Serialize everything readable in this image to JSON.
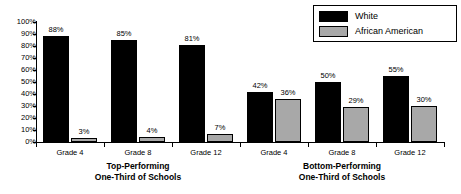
{
  "chart_data": {
    "type": "bar",
    "title": "",
    "xlabel": "",
    "ylabel": "",
    "ylim": [
      0,
      100
    ],
    "grid": false,
    "legend_position": "top-right",
    "categories": [
      "Grade 4",
      "Grade 8",
      "Grade 12",
      "Grade 4",
      "Grade 8",
      "Grade 12"
    ],
    "groups": [
      {
        "name": "Top-Performing One-Third of Schools",
        "title_line1": "Top-Performing",
        "title_line2": "One-Third of Schools",
        "categories": [
          "Grade 4",
          "Grade 8",
          "Grade 12"
        ]
      },
      {
        "name": "Bottom-Performing One-Third of Schools",
        "title_line1": "Bottom-Performing",
        "title_line2": "One-Third of Schools",
        "categories": [
          "Grade 4",
          "Grade 8",
          "Grade 12"
        ]
      }
    ],
    "series": [
      {
        "name": "White",
        "color": "#000000",
        "values": [
          88,
          85,
          81,
          42,
          50,
          55
        ],
        "labels": [
          "88%",
          "85%",
          "81%",
          "42%",
          "50%",
          "55%"
        ]
      },
      {
        "name": "African American",
        "color": "#a8a8a8",
        "values": [
          3,
          4,
          7,
          36,
          29,
          30
        ],
        "labels": [
          "3%",
          "4%",
          "7%",
          "36%",
          "29%",
          "30%"
        ]
      }
    ],
    "ytick_labels": [
      "100%",
      "90%",
      "80%",
      "70%",
      "60%",
      "50%",
      "40%",
      "30%",
      "20%",
      "10%",
      "0%"
    ],
    "ytick_values": [
      100,
      90,
      80,
      70,
      60,
      50,
      40,
      30,
      20,
      10,
      0
    ]
  },
  "legend": {
    "entries": [
      {
        "label": "White",
        "swatch": "black-swatch"
      },
      {
        "label": "African American",
        "swatch": "gray-swatch"
      }
    ]
  }
}
